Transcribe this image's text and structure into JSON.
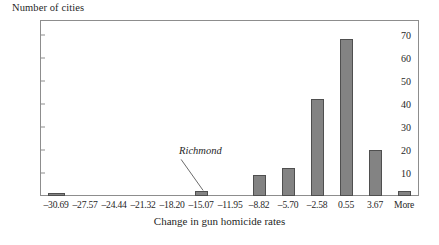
{
  "chart_data": {
    "type": "bar",
    "title": "",
    "xlabel": "Change in gun homicide rates",
    "ylabel": "Number of cities",
    "categories": [
      "–30.69",
      "–27.57",
      "–24.44",
      "–21.32",
      "–18.20",
      "–15.07",
      "–11.95",
      "–8.82",
      "–5.70",
      "–2.58",
      "0.55",
      "3.67",
      "More"
    ],
    "values": [
      1,
      0,
      0,
      0,
      0,
      2,
      0,
      9,
      12,
      42,
      68,
      20,
      2
    ],
    "ylim": [
      0,
      76
    ],
    "yticks": [
      10,
      20,
      30,
      40,
      50,
      60,
      70
    ],
    "ytick_labels": [
      "10",
      "20",
      "30",
      "40",
      "50",
      "60",
      "70"
    ],
    "grid": false,
    "legend": false,
    "annotations": [
      {
        "text": "Richmond",
        "target_category": "–15.07",
        "target_value": 2
      }
    ]
  },
  "axes": {
    "y_title": "Number of cities",
    "x_title": "Change in gun homicide rates"
  },
  "style": {
    "bar_fill": "#838383",
    "bar_stroke": "#4f4f4f",
    "frame_color": "#8d8d8d",
    "text_color": "#1f1f1f",
    "background": "#ffffff"
  }
}
